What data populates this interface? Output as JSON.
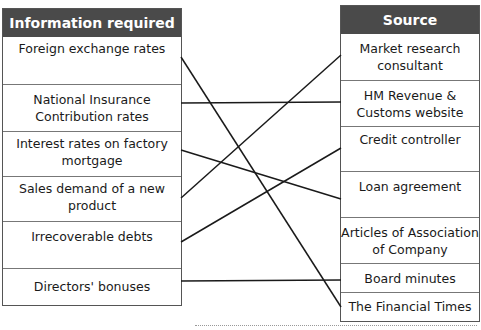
{
  "left_table": {
    "header": "Information required",
    "rows": [
      "Foreign exchange rates",
      "National Insurance Contribution rates",
      "Interest rates on factory mortgage",
      "Sales demand of a new product",
      "Irrecoverable debts",
      "Directors' bonuses"
    ]
  },
  "right_table": {
    "header": "Source",
    "rows": [
      "Market research consultant",
      "HM Revenue & Customs website",
      "Credit controller",
      "Loan agreement",
      "Articles of Association of Company",
      "Board minutes",
      "The Financial Times"
    ]
  },
  "connections": [
    {
      "from": "Foreign exchange rates",
      "to": "The Financial Times"
    },
    {
      "from": "National Insurance Contribution rates",
      "to": "HM Revenue & Customs website"
    },
    {
      "from": "Interest rates on factory mortgage",
      "to": "Loan agreement"
    },
    {
      "from": "Sales demand of a new product",
      "to": "Market research consultant"
    },
    {
      "from": "Irrecoverable debts",
      "to": "Credit controller"
    },
    {
      "from": "Directors' bonuses",
      "to": "Board minutes"
    }
  ],
  "colors": {
    "header_bg": "#4a4a4a",
    "header_text": "#ffffff",
    "line": "#1a1a1a",
    "border": "#555555"
  }
}
